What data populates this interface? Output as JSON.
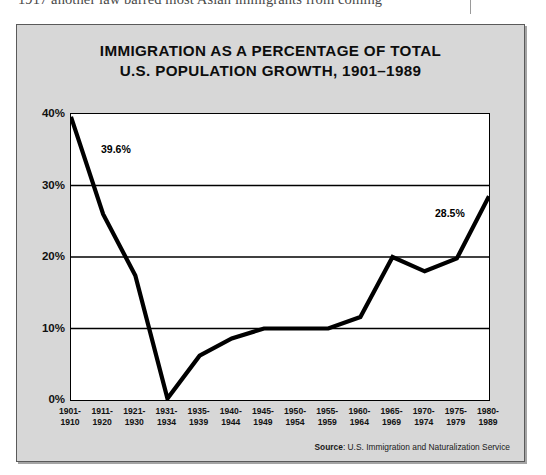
{
  "page": {
    "body_text_fragment": "1917 another law barred most Asian immigrants from coming"
  },
  "figure": {
    "title_line1": "IMMIGRATION AS A PERCENTAGE OF TOTAL",
    "title_line2": "U.S. POPULATION GROWTH, 1901–1989",
    "source_label": "Source",
    "source_text": ": U.S. Immigration and Naturalization Service",
    "colors": {
      "frame_background": "#d7d7d7",
      "plot_background": "#ffffff",
      "line": "#000000",
      "gridline": "#000000",
      "text": "#111111"
    }
  },
  "chart_data": {
    "type": "line",
    "xlabel": "",
    "ylabel": "",
    "ylim": [
      0,
      40
    ],
    "ytick_labels": [
      "0%",
      "10%",
      "20%",
      "30%",
      "40%"
    ],
    "ytick_values": [
      0,
      10,
      20,
      30,
      40
    ],
    "grid": true,
    "grid_axis": "y",
    "legend": "none",
    "categories": [
      "1901-1910",
      "1911-1920",
      "1921-1930",
      "1931-1934",
      "1935-1939",
      "1940-1944",
      "1945-1949",
      "1950-1954",
      "1955-1959",
      "1960-1964",
      "1965-1969",
      "1970-1974",
      "1975-1979",
      "1980-1989"
    ],
    "category_lines": [
      [
        "1901-",
        "1910"
      ],
      [
        "1911-",
        "1920"
      ],
      [
        "1921-",
        "1930"
      ],
      [
        "1931-",
        "1934"
      ],
      [
        "1935-",
        "1939"
      ],
      [
        "1940-",
        "1944"
      ],
      [
        "1945-",
        "1949"
      ],
      [
        "1950-",
        "1954"
      ],
      [
        "1955-",
        "1959"
      ],
      [
        "1960-",
        "1964"
      ],
      [
        "1965-",
        "1969"
      ],
      [
        "1970-",
        "1974"
      ],
      [
        "1975-",
        "1979"
      ],
      [
        "1980-",
        "1989"
      ]
    ],
    "values": [
      39.6,
      26.0,
      17.4,
      0.2,
      6.2,
      8.6,
      10.0,
      10.0,
      10.0,
      11.6,
      20.0,
      18.0,
      19.8,
      28.5
    ],
    "annotations": [
      {
        "label": "39.6%",
        "category": "1901-1910",
        "value": 39.6
      },
      {
        "label": "28.5%",
        "category": "1980-1989",
        "value": 28.5
      }
    ],
    "source": "Source: U.S. Immigration and Naturalization Service"
  }
}
